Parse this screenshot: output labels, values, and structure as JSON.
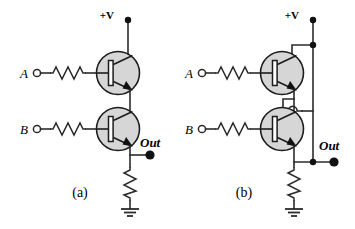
{
  "figure": {
    "background_color": "#ffffff",
    "wire_color": "#2b2b2b",
    "transistor_fill": "#d6d6d6",
    "panels": [
      {
        "id": "a",
        "caption": "(a)",
        "topology": "series",
        "supply_label": "+V",
        "inputs": [
          {
            "label": "A",
            "component": "resistor",
            "terminal": "open-circle"
          },
          {
            "label": "B",
            "component": "resistor",
            "terminal": "open-circle"
          }
        ],
        "output_label": "Out",
        "output_terminal": "filled-dot",
        "transistors": [
          {
            "type": "npn",
            "driven_by": "A",
            "position": "top"
          },
          {
            "type": "npn",
            "driven_by": "B",
            "position": "bottom"
          }
        ],
        "pulldown": "resistor",
        "ground": "earth-ground"
      },
      {
        "id": "b",
        "caption": "(b)",
        "topology": "parallel",
        "supply_label": "+V",
        "inputs": [
          {
            "label": "A",
            "component": "resistor",
            "terminal": "open-circle"
          },
          {
            "label": "B",
            "component": "resistor",
            "terminal": "open-circle"
          }
        ],
        "output_label": "Out",
        "output_terminal": "filled-dot",
        "transistors": [
          {
            "type": "npn",
            "driven_by": "A",
            "position": "top"
          },
          {
            "type": "npn",
            "driven_by": "B",
            "position": "bottom"
          }
        ],
        "pulldown": "resistor",
        "ground": "earth-ground",
        "wire_crossing": "hop"
      }
    ]
  }
}
